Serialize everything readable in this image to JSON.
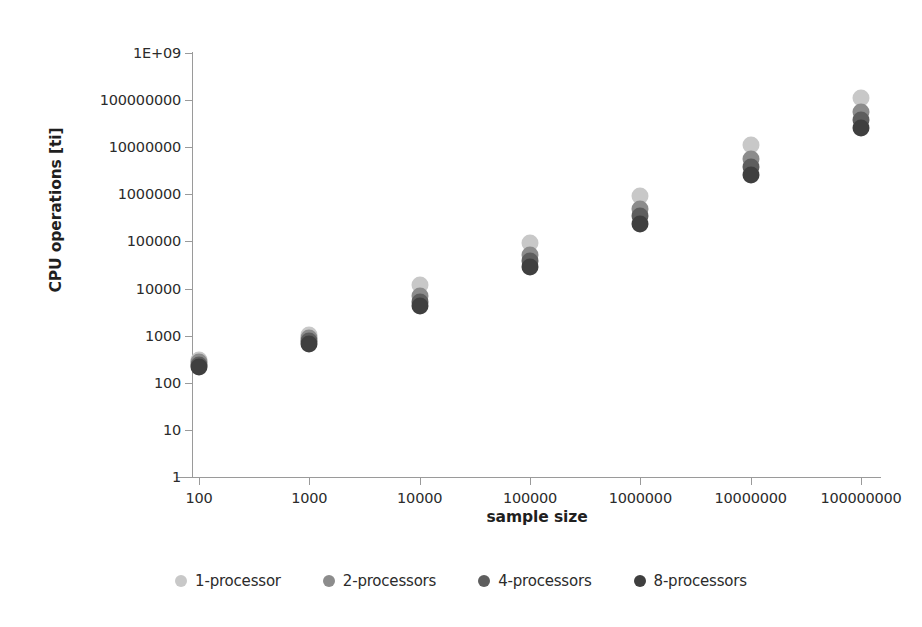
{
  "chart_data": {
    "type": "scatter",
    "title": "",
    "xlabel": "sample size",
    "ylabel": "CPU operations [ti]",
    "xscale": "log",
    "yscale": "log",
    "grid": false,
    "legend_position": "bottom",
    "x_tick_labels": [
      "100",
      "1000",
      "10000",
      "100000",
      "1000000",
      "10000000",
      "100000000"
    ],
    "x": [
      100,
      1000,
      10000,
      100000,
      1000000,
      10000000,
      100000000
    ],
    "y_tick_labels": [
      "1E+09",
      "100000000",
      "10000000",
      "1000000",
      "100000",
      "10000",
      "1000",
      "100",
      "10",
      "1"
    ],
    "y_ticks": [
      1000000000,
      100000000,
      10000000,
      1000000,
      100000,
      10000,
      1000,
      100,
      10,
      1
    ],
    "ylim": [
      1,
      1000000000
    ],
    "series": [
      {
        "name": "1-processor",
        "color": "#c8c8c8",
        "values": [
          310,
          1050,
          12000,
          92000,
          900000,
          11000000,
          110000000
        ]
      },
      {
        "name": "2-processors",
        "color": "#8c8c8c",
        "values": [
          270,
          880,
          7000,
          52000,
          480000,
          5500000,
          55000000
        ]
      },
      {
        "name": "4-processors",
        "color": "#5e5e5e",
        "values": [
          240,
          760,
          5300,
          38000,
          340000,
          3800000,
          38000000
        ]
      },
      {
        "name": "8-processors",
        "color": "#3f3f3f",
        "values": [
          215,
          650,
          4200,
          29000,
          240000,
          2600000,
          26000000
        ]
      }
    ]
  },
  "axis": {
    "y_title": "CPU operations [ti]",
    "x_title": "sample size"
  },
  "legend": {
    "items": [
      {
        "label": "1-processor",
        "color": "#c8c8c8"
      },
      {
        "label": "2-processors",
        "color": "#8c8c8c"
      },
      {
        "label": "4-processors",
        "color": "#5e5e5e"
      },
      {
        "label": "8-processors",
        "color": "#3f3f3f"
      }
    ]
  }
}
